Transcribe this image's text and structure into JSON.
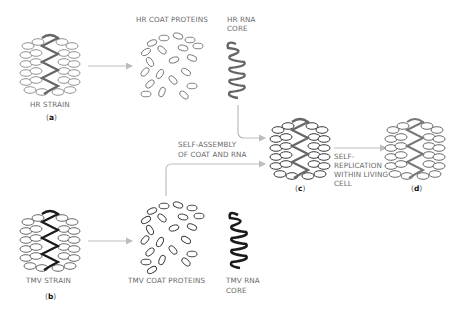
{
  "diagram": {
    "title": "",
    "colors": {
      "hr_rna": "#666666",
      "tmv_rna": "#1a1a1a",
      "protein_outline": "#555555",
      "arrow": "#bdbdbd",
      "label": "#6a6a6a"
    },
    "nodes": {
      "hr_strain": {
        "label": "HR STRAIN",
        "tag": "a"
      },
      "hr_coat_proteins": {
        "label": "HR COAT PROTEINS"
      },
      "hr_rna_core": {
        "label_line1": "HR RNA",
        "label_line2": "CORE"
      },
      "tmv_strain": {
        "label": "TMV  STRAIN",
        "tag": "b"
      },
      "tmv_coat_proteins": {
        "label": "TMV COAT PROTEINS"
      },
      "tmv_rna_core": {
        "label_line1": "TMV RNA",
        "label_line2": "CORE"
      },
      "hybrid_virus": {
        "tag": "c"
      },
      "progeny_virus": {
        "tag": "d"
      }
    },
    "edges": {
      "self_assembly": {
        "line1": "SELF-ASSEMBLY",
        "line2": "OF COAT AND RNA"
      },
      "self_replication": {
        "line1": "SELF-",
        "line2": "REPLICATION",
        "line3": "WITHIN LIVING",
        "line4": "CELL"
      }
    }
  }
}
